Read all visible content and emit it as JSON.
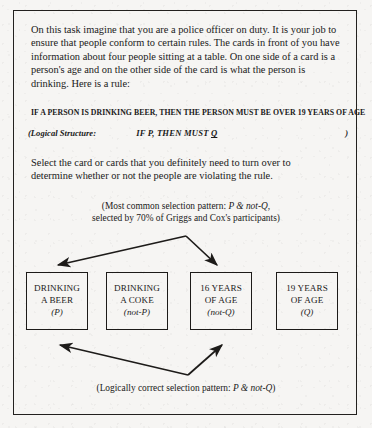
{
  "document": {
    "intro_paragraph": "On this task imagine that you are a police officer on duty. It is your job to ensure that people conform to certain rules. The cards in front of you have information about four people sitting at a table. On one side of a card is a person's age and on the other side of the card is what the person is drinking. Here is a rule:",
    "rule": "IF A PERSON IS DRINKING BEER,  THEN THE PERSON MUST BE OVER 19 YEARS OF AGE",
    "logical_structure": {
      "label": "(Logical Structure:",
      "form_prefix": "IF P, THEN MUST ",
      "form_underlined": "Q",
      "closing_paren": ")"
    },
    "instruction": "Select the card or cards that you definitely need to turn over to determine whether or not the people are violating the rule.",
    "note_top": {
      "line1_prefix": "(Most common selection pattern: ",
      "line1_italic": "P & not-Q",
      "line1_suffix": ",",
      "line2": "selected by 70% of Griggs and Cox's participants)"
    },
    "note_bottom": {
      "prefix": "(Logically correct selection pattern: ",
      "italic": "P & not-Q",
      "suffix": ")"
    },
    "cards": [
      {
        "line1": "DRINKING",
        "line2": "A BEER",
        "logic": "(P)"
      },
      {
        "line1": "DRINKING",
        "line2": "A COKE",
        "logic": "(not-P)"
      },
      {
        "line1": "16 YEARS",
        "line2": "OF AGE",
        "logic": "(not-Q)"
      },
      {
        "line1": "19 YEARS",
        "line2": "OF AGE",
        "logic": "(Q)"
      }
    ],
    "colors": {
      "paper": "#f6f5f3",
      "ink": "#1a1a1a",
      "border": "#23211f"
    }
  }
}
